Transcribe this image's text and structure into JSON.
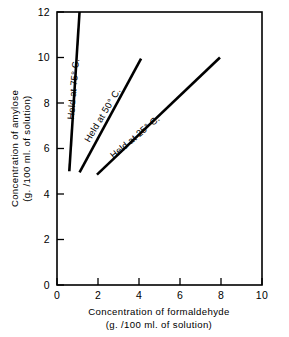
{
  "chart_data": {
    "type": "line",
    "title": "",
    "xlabel": "Concentration of formaldehyde",
    "xlabel_units": "(g. /100 ml. of solution)",
    "ylabel": "Concentration of amylose",
    "ylabel_units": "(g. /100 ml. of solution)",
    "xlim": [
      0,
      10
    ],
    "ylim": [
      0,
      12
    ],
    "xticks": [
      "0",
      "2",
      "4",
      "6",
      "8",
      "10"
    ],
    "xtick_values": [
      0,
      2,
      4,
      6,
      8,
      10
    ],
    "yticks": [
      "0",
      "2",
      "4",
      "6",
      "8",
      "10",
      "12"
    ],
    "ytick_values": [
      0,
      2,
      4,
      6,
      8,
      10,
      12
    ],
    "grid": false,
    "legend_position": "inline-labels",
    "line_color": "#000000",
    "background_color": "#ffffff",
    "series": [
      {
        "name": "Held at 75° C.",
        "label": "Held at 75° C.",
        "x": [
          0.6,
          1.1
        ],
        "y": [
          5.0,
          12.0
        ],
        "label_angle": -85,
        "label_x": 0.95,
        "label_y": 8.6
      },
      {
        "name": "Held at 50° C.",
        "label": "Held at 50° C.",
        "x": [
          1.1,
          4.1
        ],
        "y": [
          4.95,
          9.95
        ],
        "label_angle": -59,
        "label_x": 2.35,
        "label_y": 7.4
      },
      {
        "name": "Held at 25° C.",
        "label": "Held at 25° C.",
        "x": [
          1.95,
          7.95
        ],
        "y": [
          4.85,
          10.0
        ],
        "label_angle": -40,
        "label_x": 3.9,
        "label_y": 6.4
      }
    ]
  }
}
